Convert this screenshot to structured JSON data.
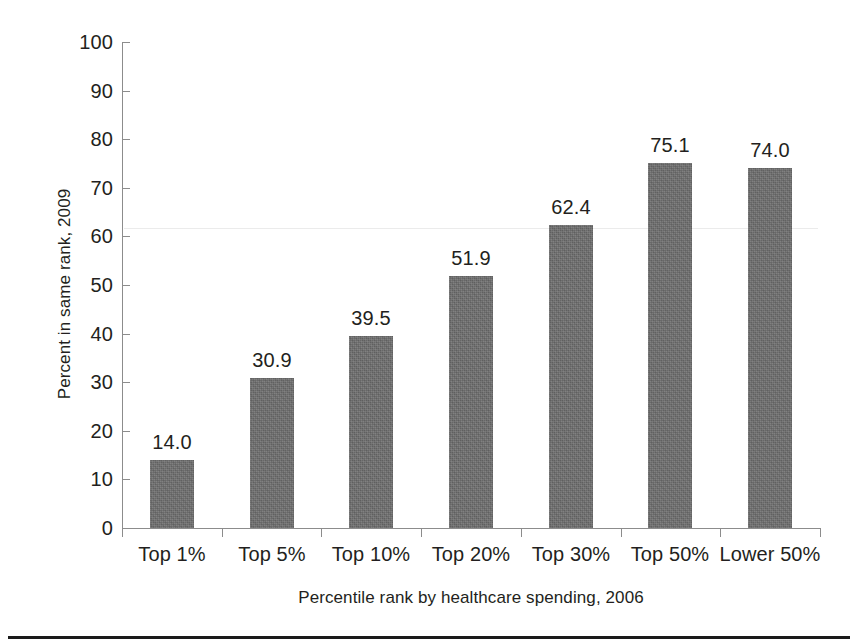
{
  "chart_data": {
    "type": "bar",
    "title": "",
    "subtitle": "",
    "xlabel": "Percentile rank by healthcare spending, 2006",
    "ylabel": "Percent in same rank, 2009",
    "categories": [
      "Top 1%",
      "Top 5%",
      "Top 10%",
      "Top 20%",
      "Top 30%",
      "Top 50%",
      "Lower 50%"
    ],
    "values": [
      14.0,
      30.9,
      39.5,
      51.9,
      62.4,
      75.1,
      74.0
    ],
    "value_labels": [
      "14.0",
      "30.9",
      "39.5",
      "51.9",
      "62.4",
      "75.1",
      "74.0"
    ],
    "ylim": [
      0,
      100
    ],
    "ytick_values": [
      0,
      10,
      20,
      30,
      40,
      50,
      60,
      70,
      80,
      90,
      100
    ],
    "ytick_labels": [
      "0",
      "10",
      "20",
      "30",
      "40",
      "50",
      "60",
      "70",
      "80",
      "90",
      "100"
    ],
    "grid": false,
    "legend": "none",
    "bar_color": "#6e6e6e",
    "axis_color": "#8c8c8c",
    "text_color": "#231f20",
    "background": "#ffffff"
  }
}
